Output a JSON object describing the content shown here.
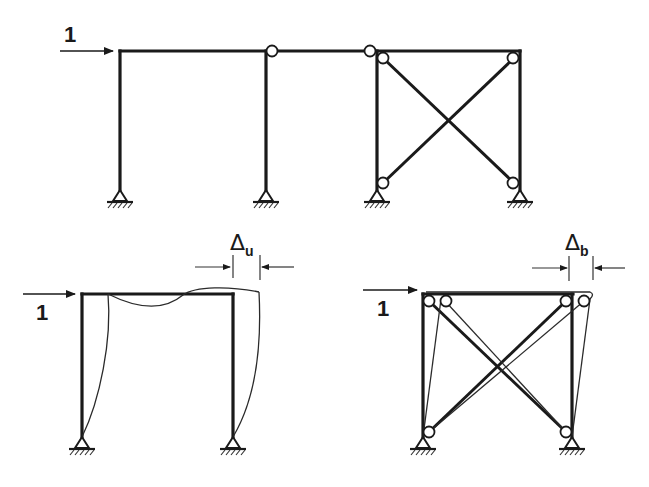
{
  "title_fragment": "",
  "colors": {
    "line": "#1a1a1a",
    "background": "#ffffff",
    "deflected_line": "#2a2a2a"
  },
  "top_diagram": {
    "name": "Frame with leaning column and pin-connected braced bay",
    "load_label": "1",
    "load_direction": "horizontal-right",
    "members": [
      "rigid-frame-bay",
      "leaning-column",
      "x-braced-bay"
    ],
    "hinges": 6,
    "supports": 4,
    "support_type": "pinned"
  },
  "bottom_left_diagram": {
    "name": "Unbraced rigid frame (deflected shape)",
    "load_label": "1",
    "displacement_symbol": "Δ",
    "displacement_subscript": "u",
    "supports": 2,
    "support_type": "pinned"
  },
  "bottom_right_diagram": {
    "name": "Braced frame (deflected shape)",
    "load_label": "1",
    "displacement_symbol": "Δ",
    "displacement_subscript": "b",
    "supports": 2,
    "support_type": "pinned"
  }
}
